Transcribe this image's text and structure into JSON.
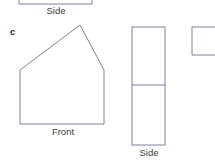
{
  "page": {
    "background_color": "#ffffff",
    "width": 215,
    "height": 167,
    "stroke_color": "#7b81a3",
    "text_color": "#3c3c3c"
  },
  "part_label": {
    "text": "c"
  },
  "figures": {
    "side_top": {
      "label": "Side",
      "shape": "rectangle-clipped-top",
      "x": 19,
      "y": -20,
      "width": 73,
      "height": 24
    },
    "front_pentagon": {
      "label": "Front",
      "shape": "pentagon",
      "points": "20,70 80,25 104,70 104,124 20,124"
    },
    "side_divided": {
      "label": "Side",
      "shape": "rectangle-divided",
      "x": 132,
      "y": 27,
      "width": 33,
      "height": 118,
      "divider_y": 85
    },
    "side_partial_right": {
      "label": "",
      "shape": "rectangle-clipped-right",
      "x": 192,
      "y": 27,
      "width": 30,
      "height": 28
    }
  }
}
